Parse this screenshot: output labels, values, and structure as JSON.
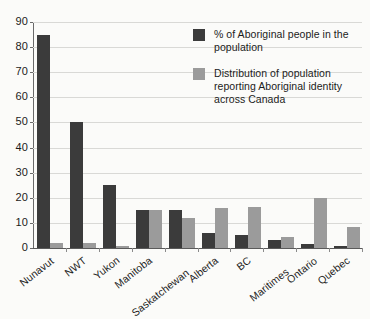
{
  "chart_data": {
    "type": "bar",
    "title": "",
    "xlabel": "",
    "ylabel": "",
    "ylim": [
      0,
      90
    ],
    "y_ticks": [
      0,
      10,
      20,
      30,
      40,
      50,
      60,
      70,
      80,
      90
    ],
    "grid": true,
    "legend_position": "top-right",
    "categories": [
      "Nunavut",
      "NWT",
      "Yukon",
      "Manitoba",
      "Saskatchewan",
      "Alberta",
      "BC",
      "Maritimes",
      "Ontario",
      "Quebec"
    ],
    "series": [
      {
        "name": "% of Aboriginal people in the population",
        "color": "#3b3b3b",
        "values": [
          85,
          50,
          25,
          15,
          15,
          6,
          5,
          3,
          1.5,
          1
        ]
      },
      {
        "name": "Distribution of population reporting Aboriginal identity across Canada",
        "color": "#9b9b9b",
        "values": [
          2,
          2,
          1,
          15,
          12,
          16,
          16.5,
          4.5,
          20,
          8.5
        ]
      }
    ]
  },
  "legend": {
    "entries": [
      {
        "label": "% of Aboriginal people in the population",
        "color": "#3b3b3b"
      },
      {
        "label": "Distribution of population reporting Aboriginal identity across Canada",
        "color": "#9b9b9b"
      }
    ]
  },
  "axes": {
    "y_tick_labels": [
      "90",
      "80",
      "70",
      "60",
      "50",
      "40",
      "30",
      "20",
      "10",
      "0"
    ],
    "x_tick_labels": [
      "Nunavut",
      "NWT",
      "Yukon",
      "Manitoba",
      "Saskatchewan",
      "Alberta",
      "BC",
      "Maritimes",
      "Ontario",
      "Quebec"
    ]
  },
  "colors": {
    "series_dark": "#3b3b3b",
    "series_light": "#9b9b9b",
    "gridline": "#d9d9d6",
    "axis": "#6a6a6a",
    "background": "#fbfbf9"
  }
}
